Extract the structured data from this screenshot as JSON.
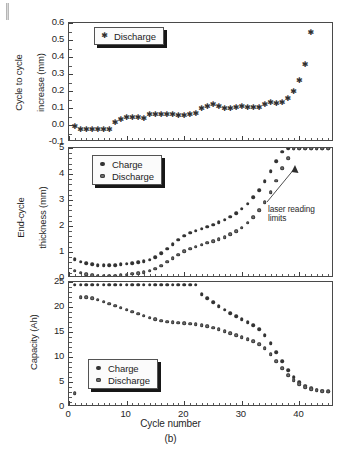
{
  "figure": {
    "caption": "(b)",
    "xlabel": "Cycle number"
  },
  "panels": {
    "top": {
      "ylabel_line1": "Cycle to cycle",
      "ylabel_line2": "increase (mm)",
      "legend": [
        {
          "label": "Discharge",
          "marker": "star",
          "color": "#303030"
        }
      ],
      "yticks": [
        "-0.1",
        "0.0",
        "0.1",
        "0.2",
        "0.3",
        "0.4",
        "0.5",
        "0.6"
      ]
    },
    "middle": {
      "ylabel_line1": "End-cycle",
      "ylabel_line2": "thickness (mm)",
      "legend": [
        {
          "label": "Charge",
          "marker": "dot",
          "color": "#333333"
        },
        {
          "label": "Discharge",
          "marker": "dot",
          "color": "#6f6f6f"
        }
      ],
      "yticks": [
        "0",
        "1",
        "2",
        "3",
        "4",
        "5"
      ],
      "annotation": "laser reading\nlimits"
    },
    "bottom": {
      "ylabel": "Capacity (Ah)",
      "legend": [
        {
          "label": "Charge",
          "marker": "dot",
          "color": "#333333"
        },
        {
          "label": "Discharge",
          "marker": "dot",
          "color": "#6f6f6f"
        }
      ],
      "yticks": [
        "0",
        "5",
        "10",
        "15",
        "20",
        "25"
      ]
    }
  },
  "xticks": [
    "0",
    "10",
    "20",
    "30",
    "40"
  ],
  "chart_data": [
    {
      "type": "scatter",
      "id": "cycle-to-cycle-increase",
      "title": "",
      "xlabel": "Cycle number",
      "ylabel": "Cycle to cycle increase (mm)",
      "xlim": [
        0,
        46
      ],
      "ylim": [
        -0.1,
        0.6
      ],
      "yticks": [
        -0.1,
        0.0,
        0.1,
        0.2,
        0.3,
        0.4,
        0.5,
        0.6
      ],
      "xticks": [
        0,
        10,
        20,
        30,
        40
      ],
      "grid": false,
      "legend_position": "top-left",
      "series": [
        {
          "name": "Discharge",
          "marker": "star",
          "color": "#303030",
          "x": [
            1,
            2,
            3,
            4,
            5,
            6,
            7,
            8,
            9,
            10,
            11,
            12,
            13,
            14,
            15,
            16,
            17,
            18,
            19,
            20,
            21,
            22,
            23,
            24,
            25,
            26,
            27,
            28,
            29,
            30,
            31,
            32,
            33,
            34,
            35,
            36,
            37,
            38,
            39,
            40,
            41,
            42
          ],
          "y": [
            -0.01,
            -0.027,
            -0.028,
            -0.028,
            -0.028,
            -0.029,
            -0.028,
            0.014,
            0.03,
            0.039,
            0.041,
            0.039,
            0.038,
            0.057,
            0.06,
            0.06,
            0.059,
            0.059,
            0.053,
            0.055,
            0.056,
            0.063,
            0.095,
            0.103,
            0.116,
            0.107,
            0.093,
            0.095,
            0.102,
            0.103,
            0.1,
            0.101,
            0.102,
            0.117,
            0.127,
            0.122,
            0.127,
            0.152,
            0.195,
            0.258,
            0.355,
            0.54
          ]
        }
      ]
    },
    {
      "type": "scatter",
      "id": "end-cycle-thickness",
      "title": "",
      "xlabel": "Cycle number",
      "ylabel": "End-cycle thickness (mm)",
      "xlim": [
        0,
        46
      ],
      "ylim": [
        0,
        5
      ],
      "yticks": [
        0,
        1,
        2,
        3,
        4,
        5
      ],
      "xticks": [
        0,
        10,
        20,
        30,
        40
      ],
      "grid": false,
      "legend_position": "top-left",
      "annotations": [
        {
          "text": "laser reading limits",
          "x": 40,
          "y": 2.35,
          "points_to_x": 38.5,
          "points_to_y": 4.85
        }
      ],
      "series": [
        {
          "name": "Charge",
          "marker": "dot",
          "color": "#333333",
          "x": [
            1,
            2,
            3,
            4,
            5,
            6,
            7,
            8,
            9,
            10,
            11,
            12,
            13,
            14,
            15,
            16,
            17,
            18,
            19,
            20,
            21,
            22,
            23,
            24,
            25,
            26,
            27,
            28,
            29,
            30,
            31,
            32,
            33,
            34,
            35,
            36,
            37,
            38,
            39,
            40,
            41,
            42,
            43,
            44,
            45
          ],
          "y": [
            0.72,
            0.62,
            0.56,
            0.52,
            0.5,
            0.49,
            0.49,
            0.5,
            0.52,
            0.55,
            0.57,
            0.6,
            0.64,
            0.7,
            0.8,
            0.95,
            1.12,
            1.3,
            1.48,
            1.62,
            1.74,
            1.82,
            1.9,
            1.98,
            2.05,
            2.14,
            2.24,
            2.36,
            2.5,
            2.66,
            2.85,
            3.1,
            3.38,
            3.72,
            4.1,
            4.5,
            4.85,
            5.0,
            5.0,
            5.0,
            5.0,
            5.0,
            5.0,
            5.0,
            5.0
          ]
        },
        {
          "name": "Discharge",
          "marker": "dot",
          "color": "#6f6f6f",
          "x": [
            1,
            2,
            3,
            4,
            5,
            6,
            7,
            8,
            9,
            10,
            11,
            12,
            13,
            14,
            15,
            16,
            17,
            18,
            19,
            20,
            21,
            22,
            23,
            24,
            25,
            26,
            27,
            28,
            29,
            30,
            31,
            32,
            33,
            34,
            35,
            36,
            37,
            38,
            39,
            40,
            41,
            42,
            43,
            44,
            45
          ],
          "y": [
            0.28,
            0.2,
            0.14,
            0.11,
            0.09,
            0.08,
            0.08,
            0.09,
            0.11,
            0.13,
            0.16,
            0.19,
            0.23,
            0.28,
            0.36,
            0.48,
            0.62,
            0.76,
            0.9,
            1.02,
            1.12,
            1.2,
            1.28,
            1.35,
            1.42,
            1.5,
            1.58,
            1.68,
            1.8,
            1.94,
            2.12,
            2.34,
            2.6,
            2.92,
            3.3,
            3.74,
            4.22,
            4.6,
            5.0,
            5.0,
            5.0,
            5.0,
            5.0,
            5.0,
            5.0
          ]
        }
      ]
    },
    {
      "type": "scatter",
      "id": "capacity",
      "title": "",
      "xlabel": "Cycle number",
      "ylabel": "Capacity (Ah)",
      "xlim": [
        0,
        46
      ],
      "ylim": [
        0,
        25
      ],
      "yticks": [
        0,
        5,
        10,
        15,
        20,
        25
      ],
      "xticks": [
        0,
        10,
        20,
        30,
        40
      ],
      "grid": false,
      "legend_position": "bottom-left",
      "series": [
        {
          "name": "Charge",
          "marker": "dot",
          "color": "#333333",
          "x": [
            1,
            2,
            3,
            4,
            5,
            6,
            7,
            8,
            9,
            10,
            11,
            12,
            13,
            14,
            15,
            16,
            17,
            18,
            19,
            20,
            21,
            22,
            23,
            24,
            25,
            26,
            27,
            28,
            29,
            30,
            31,
            32,
            33,
            34,
            35,
            36,
            37,
            38,
            39,
            40,
            41,
            42,
            43,
            44,
            45
          ],
          "y": [
            24.5,
            24.5,
            24.5,
            24.5,
            24.5,
            24.5,
            24.5,
            24.5,
            24.5,
            24.5,
            24.5,
            24.5,
            24.5,
            24.5,
            24.5,
            24.5,
            24.5,
            24.5,
            24.5,
            24.5,
            24.5,
            24.5,
            22.6,
            21.8,
            21.0,
            20.2,
            19.5,
            18.8,
            18.2,
            17.6,
            17.0,
            16.4,
            15.6,
            14.4,
            12.8,
            11.0,
            9.2,
            7.4,
            6.0,
            5.0,
            4.3,
            3.8,
            3.5,
            3.3,
            3.2
          ]
        },
        {
          "name": "Discharge",
          "marker": "dot",
          "color": "#6f6f6f",
          "x": [
            1,
            2,
            3,
            4,
            5,
            6,
            7,
            8,
            9,
            10,
            11,
            12,
            13,
            14,
            15,
            16,
            17,
            18,
            19,
            20,
            21,
            22,
            23,
            24,
            25,
            26,
            27,
            28,
            29,
            30,
            31,
            32,
            33,
            34,
            35,
            36,
            37,
            38,
            39,
            40,
            41,
            42,
            43,
            44,
            45
          ],
          "y": [
            2.8,
            22.0,
            22.0,
            21.8,
            21.5,
            21.1,
            20.7,
            20.3,
            19.9,
            19.5,
            19.1,
            18.7,
            18.3,
            17.9,
            17.6,
            17.3,
            17.1,
            17.0,
            16.9,
            16.8,
            16.7,
            16.6,
            16.4,
            16.2,
            15.9,
            15.6,
            15.2,
            14.8,
            14.4,
            14.0,
            13.6,
            13.2,
            12.6,
            11.8,
            10.6,
            9.2,
            7.8,
            6.4,
            5.4,
            4.6,
            4.0,
            3.6,
            3.4,
            3.2,
            3.1
          ]
        }
      ]
    }
  ]
}
